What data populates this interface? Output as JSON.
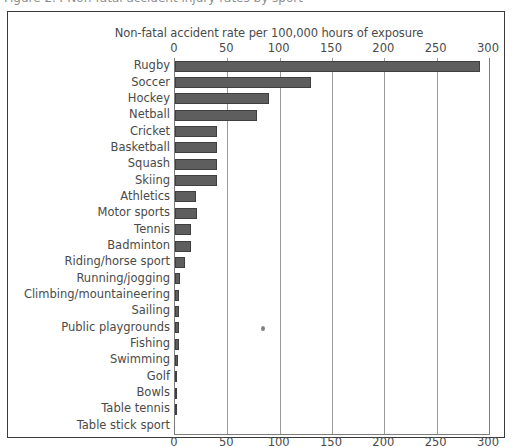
{
  "figure": {
    "caption_clipped": "Figure 2.4  Non-fatal accident injury rates by sport"
  },
  "chart_data": {
    "type": "bar",
    "orientation": "horizontal",
    "title": "",
    "xlabel": "Non-fatal accident rate per 100,000 hours of exposure",
    "ylabel": "",
    "xlim": [
      0,
      300
    ],
    "xticks": [
      0,
      50,
      100,
      150,
      200,
      250,
      300
    ],
    "xtick_labels": [
      "0",
      "50",
      "100",
      "150",
      "200",
      "250",
      "300"
    ],
    "grid": true,
    "grid_axis": "x",
    "axis_top": true,
    "axis_bottom": true,
    "legend": false,
    "bar_color": "#5e5e5e",
    "bar_edge_color": "#3f3f3f",
    "categories": [
      "Rugby",
      "Soccer",
      "Hockey",
      "Netball",
      "Cricket",
      "Basketball",
      "Squash",
      "Skiing",
      "Athletics",
      "Motor sports",
      "Tennis",
      "Badminton",
      "Riding/horse sport",
      "Running/jogging",
      "Climbing/mountaineering",
      "Sailing",
      "Public playgrounds",
      "Fishing",
      "Swimming",
      "Golf",
      "Bowls",
      "Table tennis",
      "Table stick sport"
    ],
    "values": [
      291,
      130,
      90,
      78,
      40,
      40,
      40,
      40,
      20,
      21,
      15,
      15,
      10,
      5,
      4,
      4,
      4,
      4,
      3,
      2,
      2,
      1,
      0
    ],
    "annotations": [
      {
        "name": "ink-speck",
        "x": 82,
        "row": 16
      }
    ]
  }
}
